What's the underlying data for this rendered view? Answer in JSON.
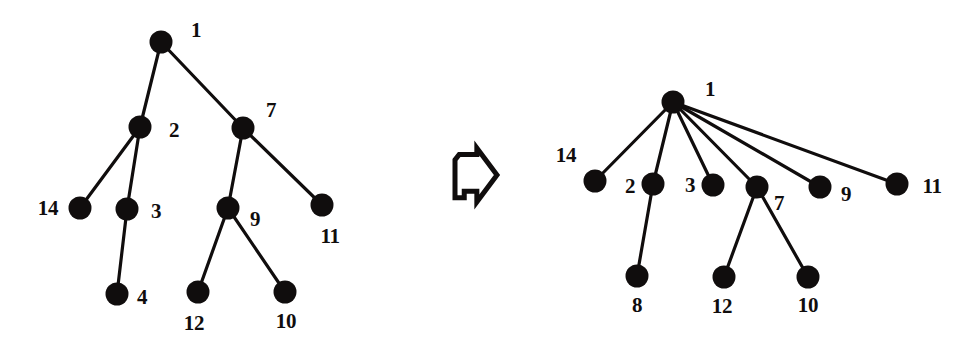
{
  "figure": {
    "width": 967,
    "height": 356,
    "background": "#ffffff",
    "ink_color": "#100d0d",
    "node_radius": 11.5,
    "edge_width": 3.2,
    "caption": ""
  },
  "transition": {
    "icon": "block-arrow-right-icon",
    "label": "",
    "x": 455,
    "y": 148,
    "width": 42,
    "height": 54
  },
  "graphs": [
    {
      "id": "left-tree",
      "title": "",
      "nodes": [
        {
          "id": "L1",
          "label": "1",
          "x": 161,
          "y": 42,
          "label_x": 196,
          "label_y": 30
        },
        {
          "id": "L2",
          "label": "2",
          "x": 140,
          "y": 127,
          "label_x": 174,
          "label_y": 130
        },
        {
          "id": "L7",
          "label": "7",
          "x": 243,
          "y": 128,
          "label_x": 271,
          "label_y": 110
        },
        {
          "id": "L14",
          "label": "14",
          "x": 80,
          "y": 208,
          "label_x": 48,
          "label_y": 208
        },
        {
          "id": "L3",
          "label": "3",
          "x": 127,
          "y": 209,
          "label_x": 156,
          "label_y": 211
        },
        {
          "id": "L9",
          "label": "9",
          "x": 228,
          "y": 208,
          "label_x": 255,
          "label_y": 219
        },
        {
          "id": "L11",
          "label": "11",
          "x": 322,
          "y": 205,
          "label_x": 330,
          "label_y": 236
        },
        {
          "id": "L4",
          "label": "4",
          "x": 117,
          "y": 294,
          "label_x": 142,
          "label_y": 297
        },
        {
          "id": "L12",
          "label": "12",
          "x": 198,
          "y": 292,
          "label_x": 194,
          "label_y": 323
        },
        {
          "id": "L10",
          "label": "10",
          "x": 285,
          "y": 292,
          "label_x": 286,
          "label_y": 321
        }
      ],
      "edges": [
        {
          "from": "L1",
          "to": "L2"
        },
        {
          "from": "L1",
          "to": "L7"
        },
        {
          "from": "L2",
          "to": "L14"
        },
        {
          "from": "L2",
          "to": "L3"
        },
        {
          "from": "L3",
          "to": "L4"
        },
        {
          "from": "L7",
          "to": "L9"
        },
        {
          "from": "L7",
          "to": "L11"
        },
        {
          "from": "L9",
          "to": "L12"
        },
        {
          "from": "L9",
          "to": "L10"
        }
      ]
    },
    {
      "id": "right-tree",
      "title": "",
      "nodes": [
        {
          "id": "R1",
          "label": "1",
          "x": 673,
          "y": 102,
          "label_x": 710,
          "label_y": 89
        },
        {
          "id": "R14",
          "label": "14",
          "x": 595,
          "y": 181,
          "label_x": 566,
          "label_y": 155
        },
        {
          "id": "R2",
          "label": "2",
          "x": 653,
          "y": 184,
          "label_x": 630,
          "label_y": 186
        },
        {
          "id": "R3",
          "label": "3",
          "x": 713,
          "y": 185,
          "label_x": 690,
          "label_y": 185
        },
        {
          "id": "R7",
          "label": "7",
          "x": 757,
          "y": 187,
          "label_x": 779,
          "label_y": 203
        },
        {
          "id": "R9",
          "label": "9",
          "x": 820,
          "y": 187,
          "label_x": 846,
          "label_y": 194
        },
        {
          "id": "R11",
          "label": "11",
          "x": 897,
          "y": 184,
          "label_x": 932,
          "label_y": 186
        },
        {
          "id": "R8",
          "label": "8",
          "x": 637,
          "y": 276,
          "label_x": 637,
          "label_y": 305
        },
        {
          "id": "R12",
          "label": "12",
          "x": 724,
          "y": 277,
          "label_x": 722,
          "label_y": 306
        },
        {
          "id": "R10",
          "label": "10",
          "x": 808,
          "y": 277,
          "label_x": 808,
          "label_y": 305
        }
      ],
      "edges": [
        {
          "from": "R1",
          "to": "R14"
        },
        {
          "from": "R1",
          "to": "R2"
        },
        {
          "from": "R1",
          "to": "R3"
        },
        {
          "from": "R1",
          "to": "R7"
        },
        {
          "from": "R1",
          "to": "R9"
        },
        {
          "from": "R1",
          "to": "R11"
        },
        {
          "from": "R2",
          "to": "R8"
        },
        {
          "from": "R7",
          "to": "R12"
        },
        {
          "from": "R7",
          "to": "R10"
        }
      ]
    }
  ]
}
